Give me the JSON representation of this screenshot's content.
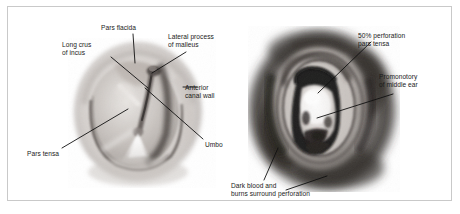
{
  "figure": {
    "frame_color": "#c9c9c9",
    "background_color": "#ffffff",
    "text_color": "#1a1a1a",
    "leader_line_color": "#111111"
  },
  "left_panel": {
    "name": "normal-tympanic-membrane-view",
    "labels": [
      {
        "id": "pars-flacida",
        "text": "Pars flacida"
      },
      {
        "id": "long-crus-incus",
        "text": "Long crus\nof incus"
      },
      {
        "id": "lateral-process-malleus",
        "text": "Lateral process\nof malleus"
      },
      {
        "id": "anterior-canal-wall",
        "text": "Anterior\ncanal wall"
      },
      {
        "id": "umbo",
        "text": "Umbo"
      },
      {
        "id": "pars-tensa",
        "text": "Pars tensa"
      }
    ]
  },
  "right_panel": {
    "name": "perforated-tympanic-membrane-view",
    "labels": [
      {
        "id": "perforation-pars-tensa",
        "text": "50% perforation\npars tensa"
      },
      {
        "id": "promonotory-middle-ear",
        "text": "Promonotory\nof middle ear"
      },
      {
        "id": "dark-blood-burns",
        "text": "Dark blood and\nburns surround perforation"
      }
    ]
  }
}
